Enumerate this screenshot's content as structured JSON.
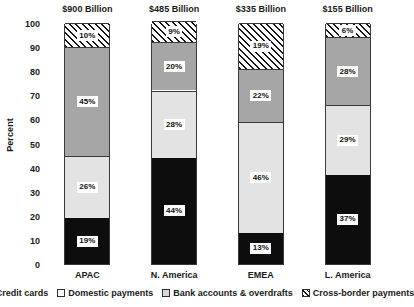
{
  "chart_data": {
    "type": "bar",
    "subtype": "stacked-bar-100-percent",
    "title": "",
    "xlabel": "",
    "ylabel": "Percent",
    "ylim": [
      0,
      100
    ],
    "yticks": [
      100,
      90,
      80,
      70,
      60,
      50,
      40,
      30,
      20,
      10,
      0
    ],
    "grid": false,
    "legend_position": "bottom",
    "categories": [
      "APAC",
      "N. America",
      "EMEA",
      "L. America"
    ],
    "category_titles": [
      "$900 Billion",
      "$485 Billion",
      "$335 Billion",
      "$155 Billion"
    ],
    "series": [
      {
        "name": "Credit cards",
        "values": [
          19,
          44,
          13,
          37
        ],
        "labels": [
          "19%",
          "44%",
          "13%",
          "37%"
        ],
        "color": "#0d0d0d",
        "pattern": "solid"
      },
      {
        "name": "Domestic payments",
        "values": [
          26,
          28,
          46,
          29
        ],
        "labels": [
          "26%",
          "28%",
          "46%",
          "29%"
        ],
        "color": "#e3e3e3",
        "pattern": "solid"
      },
      {
        "name": "Bank accounts & overdrafts",
        "values": [
          45,
          20,
          22,
          28
        ],
        "labels": [
          "45%",
          "20%",
          "22%",
          "28%"
        ],
        "color": "#a6a6a6",
        "pattern": "solid"
      },
      {
        "name": "Cross-border payments",
        "values": [
          10,
          9,
          19,
          6
        ],
        "labels": [
          "10%",
          "9%",
          "19%",
          "6%"
        ],
        "color": "#ffffff",
        "pattern": "diagonal-hatch"
      }
    ]
  },
  "axis": {
    "y_title": "Percent",
    "y_tick_labels": [
      "100",
      "90",
      "80",
      "70",
      "60",
      "50",
      "40",
      "30",
      "20",
      "10",
      "0"
    ]
  },
  "groups": [
    {
      "title": "$900 Billion",
      "label": "APAC",
      "segments": [
        {
          "series": "Credit cards",
          "label": "19%",
          "value": 19
        },
        {
          "series": "Domestic payments",
          "label": "26%",
          "value": 26
        },
        {
          "series": "Bank accounts & overdrafts",
          "label": "45%",
          "value": 45
        },
        {
          "series": "Cross-border payments",
          "label": "10%",
          "value": 10
        }
      ]
    },
    {
      "title": "$485 Billion",
      "label": "N. America",
      "segments": [
        {
          "series": "Credit cards",
          "label": "44%",
          "value": 44
        },
        {
          "series": "Domestic payments",
          "label": "28%",
          "value": 28
        },
        {
          "series": "Bank accounts & overdrafts",
          "label": "20%",
          "value": 20
        },
        {
          "series": "Cross-border payments",
          "label": "9%",
          "value": 9
        }
      ]
    },
    {
      "title": "$335 Billion",
      "label": "EMEA",
      "segments": [
        {
          "series": "Credit cards",
          "label": "13%",
          "value": 13
        },
        {
          "series": "Domestic payments",
          "label": "46%",
          "value": 46
        },
        {
          "series": "Bank accounts & overdrafts",
          "label": "22%",
          "value": 22
        },
        {
          "series": "Cross-border payments",
          "label": "19%",
          "value": 19
        }
      ]
    },
    {
      "title": "$155 Billion",
      "label": "L. America",
      "segments": [
        {
          "series": "Credit cards",
          "label": "37%",
          "value": 37
        },
        {
          "series": "Domestic payments",
          "label": "29%",
          "value": 29
        },
        {
          "series": "Bank accounts & overdrafts",
          "label": "28%",
          "value": 28
        },
        {
          "series": "Cross-border payments",
          "label": "6%",
          "value": 6
        }
      ]
    }
  ],
  "legend": {
    "items": [
      {
        "label": "Credit cards",
        "swatch": "credit",
        "color": "#0d0d0d"
      },
      {
        "label": "Domestic payments",
        "swatch": "dom",
        "color": "#ffffff"
      },
      {
        "label": "Bank accounts & overdrafts",
        "swatch": "bank",
        "color": "#d9d9d9"
      },
      {
        "label": "Cross-border payments",
        "swatch": "cross",
        "color": "#ffffff"
      }
    ]
  }
}
